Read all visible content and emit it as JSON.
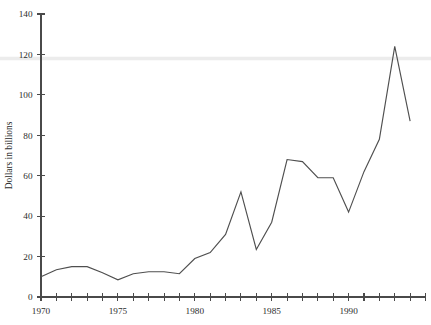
{
  "chart_data": {
    "type": "line",
    "title": "",
    "xlabel": "",
    "ylabel": "Dollars in billions",
    "xlim": [
      1970,
      1995
    ],
    "ylim": [
      0,
      140
    ],
    "grid": false,
    "legend": null,
    "y_ticks": [
      0,
      20,
      40,
      60,
      80,
      100,
      120,
      140
    ],
    "y_tick_labels": [
      "0",
      "20",
      "40",
      "60",
      "80",
      "100",
      "120",
      "140"
    ],
    "x_ticks": [
      1970,
      1971,
      1972,
      1973,
      1974,
      1975,
      1976,
      1977,
      1978,
      1979,
      1980,
      1981,
      1982,
      1983,
      1984,
      1985,
      1986,
      1987,
      1988,
      1989,
      1990,
      1991,
      1992,
      1993,
      1994,
      1995
    ],
    "x_tick_labels_shown": [
      "1970",
      "1975",
      "1980",
      "1985",
      "1990"
    ],
    "x_labeled_years": [
      1970,
      1975,
      1980,
      1985,
      1990
    ],
    "x": [
      1970,
      1971,
      1972,
      1973,
      1974,
      1975,
      1976,
      1977,
      1978,
      1979,
      1980,
      1981,
      1982,
      1983,
      1984,
      1985,
      1986,
      1987,
      1988,
      1989,
      1990,
      1991,
      1992,
      1993,
      1994
    ],
    "values": [
      10,
      13.5,
      15,
      15,
      12,
      8.5,
      11.5,
      12.5,
      12.5,
      11.5,
      19,
      22,
      31,
      52,
      23.5,
      37,
      68,
      67,
      59,
      59,
      42,
      62,
      78,
      124,
      87
    ],
    "series": [
      {
        "name": "Dollars in billions",
        "color": "#4f4f4f",
        "values": [
          10,
          13.5,
          15,
          15,
          12,
          8.5,
          11.5,
          12.5,
          12.5,
          11.5,
          19,
          22,
          31,
          52,
          23.5,
          37,
          68,
          67,
          59,
          59,
          42,
          62,
          78,
          124,
          87
        ]
      }
    ],
    "annotations": [
      {
        "name": "scan-band",
        "kind": "horizontal-band",
        "y": 118,
        "color": "#ececec"
      }
    ]
  },
  "colors": {
    "line": "#4f4f4f",
    "axis": "#4a4a4a",
    "text": "#2b2b2b",
    "background": "#ffffff",
    "band": "#ececec"
  }
}
